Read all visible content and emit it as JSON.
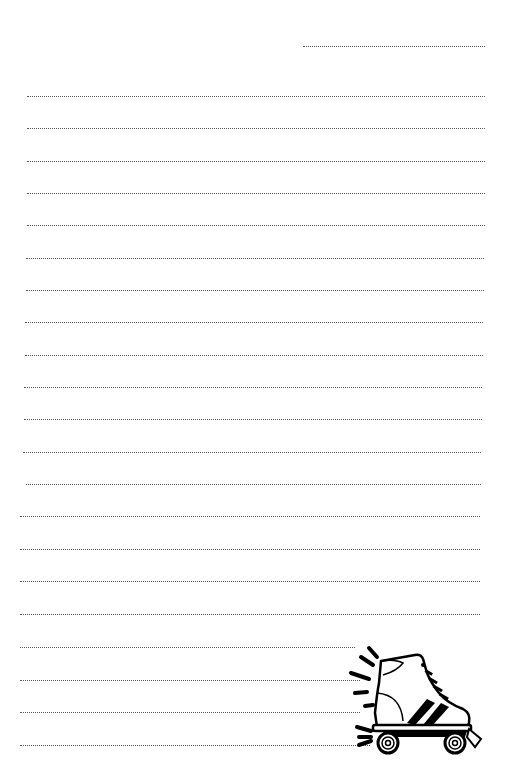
{
  "page": {
    "type": "lined-writing-paper",
    "background": "#ffffff",
    "line_color": "#555555",
    "line_style": "dotted"
  },
  "header_line": {
    "x1": 303,
    "x2": 485,
    "y": 46
  },
  "lines": [
    {
      "x1": 27,
      "x2": 485,
      "y": 96
    },
    {
      "x1": 27,
      "x2": 485,
      "y": 128
    },
    {
      "x1": 27,
      "x2": 485,
      "y": 161
    },
    {
      "x1": 27,
      "x2": 485,
      "y": 193
    },
    {
      "x1": 27,
      "x2": 485,
      "y": 225
    },
    {
      "x1": 26,
      "x2": 484,
      "y": 258
    },
    {
      "x1": 26,
      "x2": 484,
      "y": 290
    },
    {
      "x1": 25,
      "x2": 483,
      "y": 322
    },
    {
      "x1": 25,
      "x2": 483,
      "y": 355
    },
    {
      "x1": 24,
      "x2": 482,
      "y": 387
    },
    {
      "x1": 24,
      "x2": 482,
      "y": 419
    },
    {
      "x1": 23,
      "x2": 481,
      "y": 452
    },
    {
      "x1": 26,
      "x2": 481,
      "y": 484
    },
    {
      "x1": 20,
      "x2": 480,
      "y": 516
    },
    {
      "x1": 20,
      "x2": 480,
      "y": 549
    },
    {
      "x1": 20,
      "x2": 480,
      "y": 581
    },
    {
      "x1": 20,
      "x2": 480,
      "y": 614
    },
    {
      "x1": 20,
      "x2": 355,
      "y": 647
    },
    {
      "x1": 20,
      "x2": 360,
      "y": 680
    },
    {
      "x1": 20,
      "x2": 360,
      "y": 712
    },
    {
      "x1": 20,
      "x2": 370,
      "y": 745
    }
  ],
  "illustration": {
    "name": "roller-skate",
    "position": "bottom-right"
  }
}
